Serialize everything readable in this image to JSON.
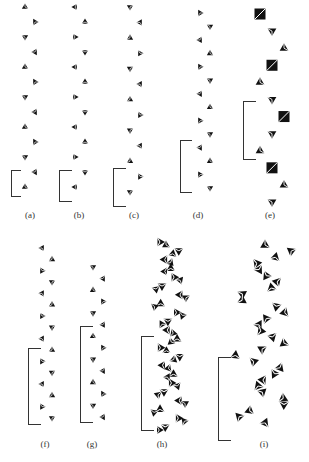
{
  "figure": {
    "panels": [
      {
        "id": "a",
        "label": "(a)",
        "units": 13,
        "style": "small"
      },
      {
        "id": "b",
        "label": "(b)",
        "units": 13,
        "style": "small"
      },
      {
        "id": "c",
        "label": "(c)",
        "units": 13,
        "style": "small"
      },
      {
        "id": "d",
        "label": "(d)",
        "units": 14,
        "style": "small"
      },
      {
        "id": "e",
        "label": "(e)",
        "units": 12,
        "style": "large"
      },
      {
        "id": "f",
        "label": "(f)",
        "units": 16,
        "style": "small"
      },
      {
        "id": "g",
        "label": "(g)",
        "units": 14,
        "style": "small"
      },
      {
        "id": "h",
        "label": "(h)",
        "units": 22,
        "style": "dense"
      },
      {
        "id": "i",
        "label": "(i)",
        "units": 30,
        "style": "helix"
      }
    ],
    "caption": "图 … (caption text cut off / illegible)"
  }
}
